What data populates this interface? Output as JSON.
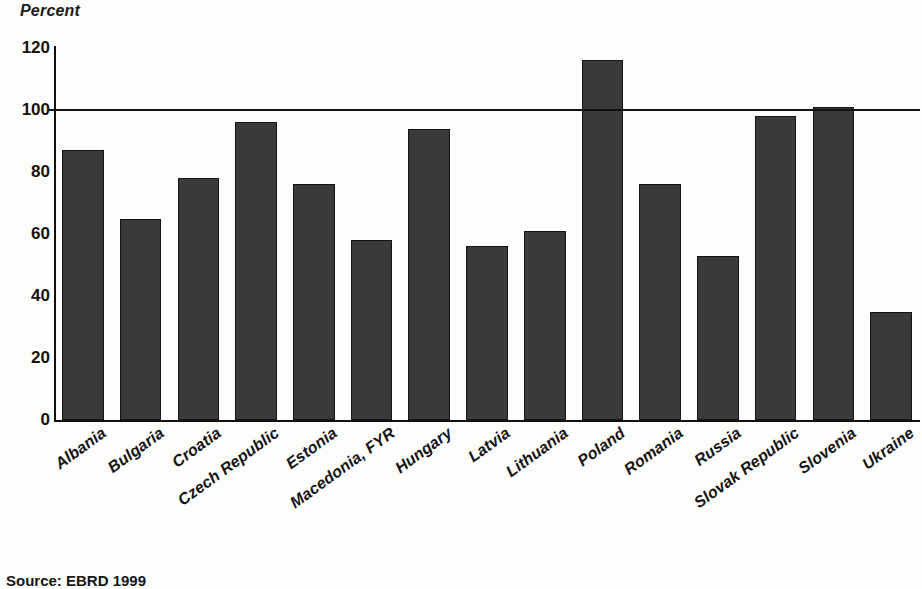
{
  "chart_data": {
    "type": "bar",
    "title": "",
    "subtitle": "",
    "xlabel": "",
    "ylabel": "Percent",
    "ylim": [
      0,
      120
    ],
    "yticks": [
      0,
      20,
      40,
      60,
      80,
      100,
      120
    ],
    "ytick_labels": [
      "0",
      "20",
      "40",
      "60",
      "80",
      "100",
      "120"
    ],
    "grid": false,
    "legend": null,
    "reference_line": {
      "value": 100,
      "label": "",
      "style": "solid"
    },
    "bar_color": "#3a3a3a",
    "bar_edge_color": "#141414",
    "categories": [
      "Albania",
      "Bulgaria",
      "Croatia",
      "Czech Republic",
      "Estonia",
      "Macedonia, FYR",
      "Hungary",
      "Latvia",
      "Lithuania",
      "Poland",
      "Romania",
      "Russia",
      "Slovak Republic",
      "Slovenia",
      "Ukraine"
    ],
    "values": [
      87,
      65,
      78,
      96,
      76,
      58,
      94,
      56,
      61,
      116,
      76,
      53,
      98,
      101,
      35
    ]
  },
  "notes": {
    "source": "Source: EBRD 1999"
  }
}
